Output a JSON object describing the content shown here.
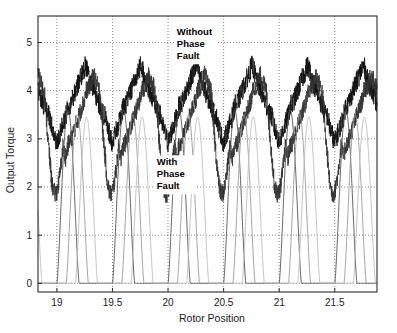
{
  "chart_data": {
    "type": "line",
    "title": "",
    "xlabel": "Rotor Position",
    "ylabel": "Output Torque",
    "xlim": [
      18.83,
      21.88
    ],
    "ylim": [
      -0.18,
      5.55
    ],
    "xticks": [
      19,
      19.5,
      20,
      20.5,
      21,
      21.5
    ],
    "xtick_labels": [
      "19",
      "19.5",
      "20",
      "20.5",
      "21",
      "21.5"
    ],
    "yticks": [
      0,
      1,
      2,
      3,
      4,
      5
    ],
    "ytick_labels": [
      "0",
      "1",
      "2",
      "3",
      "4",
      "5"
    ],
    "grid": true,
    "grid_style": "dotted",
    "legend": "none",
    "annotations": [
      {
        "name": "without-phase-fault",
        "lines": [
          "Without",
          "Phase",
          "Fault"
        ],
        "x": 20.25,
        "y": 5.15
      },
      {
        "name": "with-phase-fault",
        "lines": [
          "With",
          "Phase",
          "Fault"
        ],
        "x": 20.07,
        "y": 2.45
      }
    ],
    "series": [
      {
        "name": "Total output torque without phase fault",
        "description": "Noisy aggregate torque oscillating between about 3.0 and 5.3 with sawtooth ripple, period 0.5 rotor units",
        "color": "#111111",
        "linewidth": 0.8,
        "noise": 0.22,
        "kind": "sawtooth-envelope",
        "period": 0.5,
        "phase": 0.0,
        "ripple_min": 2.9,
        "ripple_max": 5.35,
        "mid_dip": 3.45
      },
      {
        "name": "Total output torque with phase fault",
        "description": "Noisy aggregate torque with one phase missing, dipping lower during fault intervals",
        "color": "#333333",
        "linewidth": 0.8,
        "noise": 0.2,
        "kind": "sawtooth-fault",
        "period": 0.5,
        "phase": 0.16,
        "ripple_min": 2.6,
        "ripple_max": 5.25,
        "mid_dip": 3.2
      },
      {
        "name": "Individual phase torque A",
        "description": "Smooth humped phase contribution rising from 0 to about 3.6",
        "color": "#555555",
        "linewidth": 0.9,
        "kind": "phase-hump",
        "period": 0.5,
        "phase": 0.0,
        "peak": 3.6,
        "base": 0.0
      },
      {
        "name": "Individual phase torque B",
        "description": "Smooth humped phase contribution offset by one third period",
        "color": "#9a9a9a",
        "linewidth": 0.9,
        "kind": "phase-hump",
        "period": 0.5,
        "phase": 0.1667,
        "peak": 3.5,
        "base": 0.0
      },
      {
        "name": "Individual phase torque C",
        "description": "Smooth humped phase contribution offset by two thirds period",
        "color": "#bdbdbd",
        "linewidth": 0.9,
        "kind": "phase-hump",
        "period": 0.5,
        "phase": 0.3333,
        "peak": 3.45,
        "base": 0.0
      }
    ]
  },
  "axes": {
    "frame_color": "#2b2b2b",
    "grid_color": "#6b6b6b",
    "background": "#ffffff"
  }
}
